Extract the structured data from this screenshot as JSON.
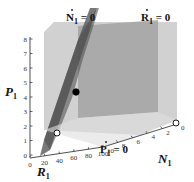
{
  "chart_data": {
    "type": "scatter",
    "title": "",
    "projection": "3d",
    "axes": {
      "x": {
        "name": "R",
        "subscript": "1",
        "ticks": [
          0,
          20,
          40,
          60,
          80,
          100
        ],
        "range": [
          0,
          100
        ]
      },
      "y": {
        "name": "N",
        "subscript": "1",
        "ticks": [
          0,
          2,
          4,
          6,
          8,
          10
        ],
        "range": [
          0,
          10
        ]
      },
      "z": {
        "name": "P",
        "subscript": "1",
        "ticks": [
          0,
          1,
          2,
          3,
          4,
          5,
          6,
          7,
          8
        ],
        "range": [
          0,
          8
        ]
      }
    },
    "surfaces": [
      {
        "name": "nullcline-N",
        "label_var": "N",
        "label_sub": "1",
        "label_rhs": " = 0",
        "shade": "#5a5a5a"
      },
      {
        "name": "nullcline-R",
        "label_var": "R",
        "label_sub": "1",
        "label_rhs": " = 0",
        "shade": "#9a9a9a"
      },
      {
        "name": "nullcline-P",
        "label_var": "P",
        "label_sub": "1",
        "label_rhs": " = 0",
        "shade": "#c4c4c4"
      }
    ],
    "points": [
      {
        "name": "interior-equilibrium",
        "style": "filled",
        "approx": {
          "R": 35,
          "N": 5,
          "P": 4
        }
      },
      {
        "name": "boundary-equilibrium-low",
        "style": "open",
        "approx": {
          "R": 20,
          "N": 10,
          "P": 1
        }
      },
      {
        "name": "boundary-equilibrium-origin",
        "style": "open",
        "approx": {
          "R": 100,
          "N": 0,
          "P": 0
        }
      }
    ],
    "grid": false,
    "legend": "none"
  }
}
